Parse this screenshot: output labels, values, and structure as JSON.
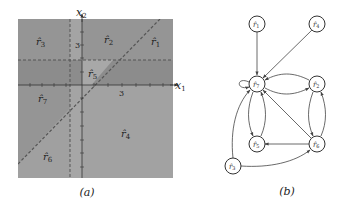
{
  "figure": {
    "panel_a": {
      "caption": "(a)",
      "axes": {
        "x_label": "x",
        "x_sub": "1",
        "y_label": "x",
        "y_sub": "2",
        "x_tick": "3",
        "y_tick": "3"
      },
      "regions": [
        {
          "id": "r1",
          "label": "r̂",
          "sub": "1"
        },
        {
          "id": "r2",
          "label": "r̂",
          "sub": "2"
        },
        {
          "id": "r3",
          "label": "r̂",
          "sub": "3"
        },
        {
          "id": "r4",
          "label": "r̂",
          "sub": "4"
        },
        {
          "id": "r5",
          "label": "r̂",
          "sub": "5"
        },
        {
          "id": "r6",
          "label": "r̂",
          "sub": "6"
        },
        {
          "id": "r7",
          "label": "r̂",
          "sub": "7"
        }
      ],
      "colors": {
        "dark": "#8f8f8f",
        "light": "#a9a9a9",
        "line": "#555555"
      }
    },
    "panel_b": {
      "caption": "(b)",
      "nodes": [
        {
          "id": "r1",
          "label": "r̂",
          "sub": "1"
        },
        {
          "id": "r4",
          "label": "r̂",
          "sub": "4"
        },
        {
          "id": "r7",
          "label": "r̂",
          "sub": "7"
        },
        {
          "id": "r2",
          "label": "r̂",
          "sub": "2"
        },
        {
          "id": "r5",
          "label": "r̂",
          "sub": "5"
        },
        {
          "id": "r6",
          "label": "r̂",
          "sub": "6"
        },
        {
          "id": "r3",
          "label": "r̂",
          "sub": "3"
        }
      ],
      "edges": [
        [
          "r1",
          "r7"
        ],
        [
          "r4",
          "r7"
        ],
        [
          "r7",
          "r7"
        ],
        [
          "r7",
          "r2"
        ],
        [
          "r2",
          "r7"
        ],
        [
          "r7",
          "r5"
        ],
        [
          "r5",
          "r7"
        ],
        [
          "r2",
          "r6"
        ],
        [
          "r6",
          "r2"
        ],
        [
          "r6",
          "r7"
        ],
        [
          "r6",
          "r5"
        ],
        [
          "r3",
          "r7"
        ],
        [
          "r3",
          "r6"
        ]
      ]
    }
  }
}
